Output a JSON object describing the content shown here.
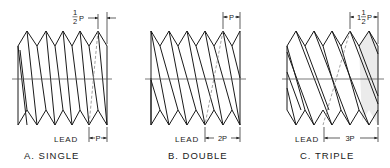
{
  "figure": {
    "type": "technical-drawing",
    "panels": [
      {
        "id": "single",
        "caption": "A. SINGLE",
        "lead_label": "LEAD",
        "lead_value": "P",
        "top_dimension": "1/2 P",
        "top_dim_whole": "",
        "top_dim_num": "1",
        "top_dim_den": "2",
        "top_dim_suffix": "P",
        "starts": 1
      },
      {
        "id": "double",
        "caption": "B. DOUBLE",
        "lead_label": "LEAD",
        "lead_value": "2P",
        "top_dimension": "P",
        "starts": 2
      },
      {
        "id": "triple",
        "caption": "C. TRIPLE",
        "lead_label": "LEAD",
        "lead_value": "3P",
        "top_dimension": "1 1/2 P",
        "top_dim_whole": "1",
        "top_dim_num": "1",
        "top_dim_den": "2",
        "top_dim_suffix": "P",
        "starts": 3
      }
    ],
    "colors": {
      "line": "#1a1a1a",
      "hidden_line": "#777777",
      "shade": "#ebebeb",
      "centerline": "#555555"
    }
  }
}
